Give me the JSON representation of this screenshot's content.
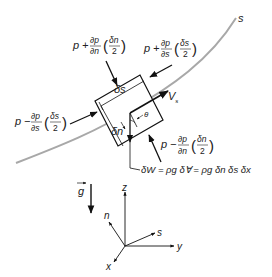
{
  "diagram": {
    "streamline": {
      "label": "s",
      "color": "#a8a8a8"
    },
    "element": {
      "ds_label": "δs",
      "dn_label": "δn",
      "theta_label": "θ",
      "velocity_label": "V",
      "velocity_subscript": "s"
    },
    "forces": {
      "top_normal": {
        "p": "p",
        "op": "+",
        "num": "∂p",
        "den": "∂n",
        "paren_num": "δn",
        "paren_den": "2"
      },
      "right_stream": {
        "p": "p",
        "op": "+",
        "num": "∂p",
        "den": "∂s",
        "paren_num": "δs",
        "paren_den": "2"
      },
      "left_stream": {
        "p": "p",
        "op": "−",
        "num": "∂p",
        "den": "∂s",
        "paren_num": "δs",
        "paren_den": "2"
      },
      "bottom_normal": {
        "p": "p",
        "op": "−",
        "num": "∂p",
        "den": "∂n",
        "paren_num": "δn",
        "paren_den": "2"
      }
    },
    "weight_equation": "δW = ρg δ∀ = ρg δn δs δx",
    "gravity_label": "g",
    "axes": {
      "z": "z",
      "n": "n",
      "s": "s",
      "y": "y",
      "x": "x"
    }
  }
}
